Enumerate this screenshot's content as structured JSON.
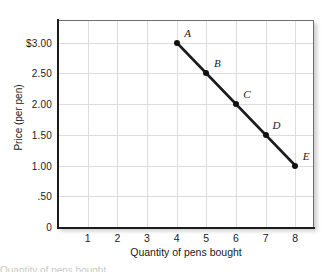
{
  "chart_data": {
    "type": "line",
    "title": "",
    "xlabel": "Quantity of pens bought",
    "ylabel": "Price (per pen)",
    "xlim": [
      0,
      8.6
    ],
    "ylim": [
      0,
      3.35
    ],
    "grid": true,
    "legend": "none",
    "x_ticks": [
      "1",
      "2",
      "3",
      "4",
      "5",
      "6",
      "7",
      "8"
    ],
    "x_tick_values": [
      1,
      2,
      3,
      4,
      5,
      6,
      7,
      8
    ],
    "y_ticks": [
      "0",
      ".50",
      "1.00",
      "1.50",
      "2.00",
      "2.50",
      "$3.00"
    ],
    "y_tick_values": [
      0,
      0.5,
      1.0,
      1.5,
      2.0,
      2.5,
      3.0
    ],
    "series": [
      {
        "name": "Demand",
        "x": [
          4,
          5,
          6,
          7,
          8
        ],
        "values": [
          3.0,
          2.5,
          2.0,
          1.5,
          1.0
        ],
        "point_labels": [
          "A",
          "B",
          "C",
          "D",
          "E"
        ],
        "line_color": "#1c1c1c",
        "marker_color": "#111111"
      }
    ],
    "annotations": [
      {
        "label": "A",
        "x": 4,
        "y": 3.0
      },
      {
        "label": "B",
        "x": 5,
        "y": 2.5
      },
      {
        "label": "C",
        "x": 6,
        "y": 2.0
      },
      {
        "label": "D",
        "x": 7,
        "y": 1.5
      },
      {
        "label": "E",
        "x": 8,
        "y": 1.0
      }
    ]
  },
  "axes": {
    "y_title": "Price (per pen)",
    "x_title": "Quantity of pens bought"
  },
  "ticks": {
    "y": [
      {
        "text": "$3.00",
        "value": 3.0
      },
      {
        "text": "2.50",
        "value": 2.5
      },
      {
        "text": "2.00",
        "value": 2.0
      },
      {
        "text": "1.50",
        "value": 1.5
      },
      {
        "text": "1.00",
        "value": 1.0
      },
      {
        "text": ".50",
        "value": 0.5
      },
      {
        "text": "0",
        "value": 0
      }
    ],
    "x": [
      {
        "text": "1",
        "value": 1
      },
      {
        "text": "2",
        "value": 2
      },
      {
        "text": "3",
        "value": 3
      },
      {
        "text": "4",
        "value": 4
      },
      {
        "text": "5",
        "value": 5
      },
      {
        "text": "6",
        "value": 6
      },
      {
        "text": "7",
        "value": 7
      },
      {
        "text": "8",
        "value": 8
      }
    ]
  },
  "caption": {
    "partial_text": "Quantity of pens bought"
  },
  "colors": {
    "line": "#1c1c1c",
    "marker": "#111111",
    "grid": "#dcdcdc",
    "frame": "#6e6e6e",
    "axis": "#1c1c1c",
    "text": "#1b1b1b",
    "background": "#ffffff"
  }
}
